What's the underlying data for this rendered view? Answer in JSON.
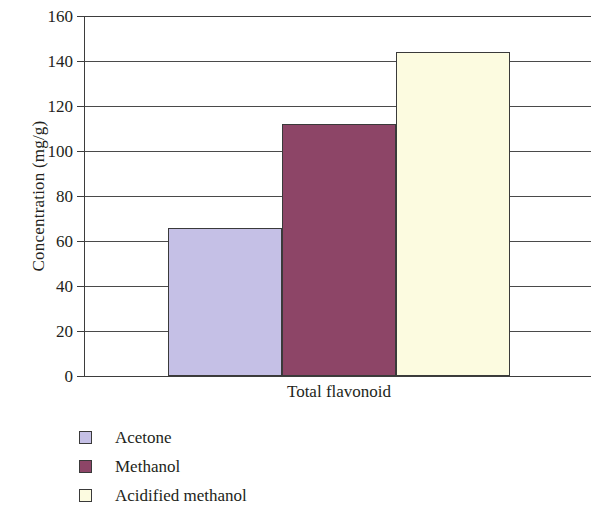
{
  "chart_data": {
    "type": "bar",
    "title": "",
    "subtitle": "",
    "xlabel": "",
    "ylabel": "Concentration (mg/g)",
    "categories": [
      "Total flavonoid"
    ],
    "series": [
      {
        "name": "Acetone",
        "values": [
          66
        ],
        "color": "#c5c0e6"
      },
      {
        "name": "Methanol",
        "values": [
          112
        ],
        "color": "#8d4567"
      },
      {
        "name": "Acidified methanol",
        "values": [
          144
        ],
        "color": "#fcfbe0"
      }
    ],
    "ylim": [
      0,
      160
    ],
    "ytick_values": [
      160,
      140,
      120,
      100,
      80,
      60,
      40,
      20,
      0
    ],
    "ytick_labels": [
      "160",
      "140",
      "120",
      "100",
      "80",
      "60",
      "40",
      "20",
      "0"
    ],
    "grid": true,
    "grid_axis": "y",
    "legend_position": "below-left",
    "bar_border_color": "#3a3a3a",
    "axis_color": "#3d3d3d"
  },
  "legend": {
    "items": [
      {
        "label": "Acetone",
        "color": "#c5c0e6"
      },
      {
        "label": "Methanol",
        "color": "#8d4567"
      },
      {
        "label": "Acidified methanol",
        "color": "#fcfbe0"
      }
    ]
  },
  "axes": {
    "y_title": "Concentration (mg/g)",
    "x_category": "Total flavonoid"
  }
}
